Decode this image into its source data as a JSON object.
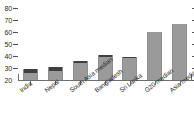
{
  "chart_data": {
    "type": "bar",
    "title": "",
    "subtitle": "",
    "xlabel": "",
    "ylabel": "",
    "ylim": [
      20,
      80
    ],
    "yticks": [
      20,
      30,
      40,
      50,
      60,
      70,
      80
    ],
    "ytick_labels": [
      "20",
      "30",
      "40",
      "50",
      "60",
      "70",
      "80"
    ],
    "grid": false,
    "legend": "none",
    "right_axis_ticks": true,
    "categories": [
      "India",
      "Nepal",
      "South Asia median",
      "Bangladesh",
      "Sri Lanka",
      "G20 median",
      "Asia median"
    ],
    "values": [
      29,
      31,
      36,
      41,
      39.5,
      60,
      66.5
    ],
    "series": [
      {
        "name": "base",
        "color": "#9a9a9a",
        "values": [
          26,
          27.5,
          34,
          39.5,
          38,
          60,
          66.5
        ]
      },
      {
        "name": "cap",
        "color": "#3f3f3f",
        "values": [
          3,
          3.5,
          2,
          1.5,
          1.5,
          0,
          0
        ]
      }
    ],
    "colors": {
      "bar": "#9a9a9a",
      "bar_cap": "#3f3f3f",
      "axis": "#6f6f6f",
      "text": "#2a2a2a",
      "background": "#ffffff"
    }
  }
}
